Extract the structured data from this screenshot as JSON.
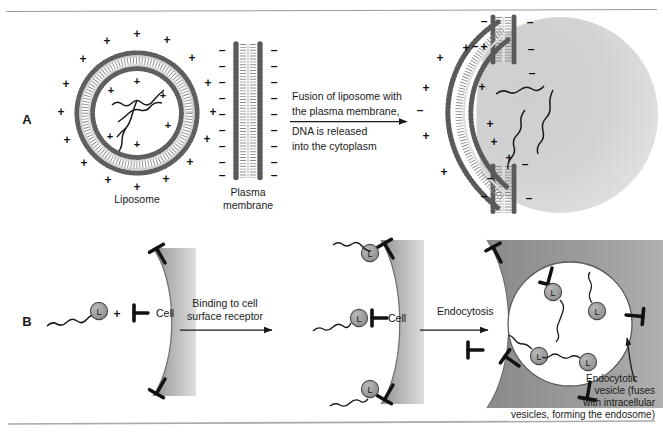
{
  "figure": {
    "background": "#ffffff",
    "top_rule": true,
    "bottom_rule": true
  },
  "panels": [
    {
      "id": "A",
      "label": "A",
      "stages": [
        {
          "name": "liposome",
          "caption": "Liposome",
          "surface_charge": "+",
          "inner_charge": "+",
          "contents": "DNA",
          "outer_charge_count": 20,
          "inner_charge_count": 8,
          "dna_strand_count": 3
        },
        {
          "name": "plasma-membrane",
          "caption_line1": "Plasma",
          "caption_line2": "membrane",
          "left_charge": "–",
          "right_charge": "–",
          "left_charge_count": 9,
          "right_charge_count": 9
        },
        {
          "name": "fused-cell",
          "caption": "",
          "liposome_charge": "+",
          "membrane_charge": "–",
          "released_dna_count": 3
        }
      ],
      "arrow": {
        "name": "fusion-arrow",
        "lines_above": [
          "Fusion of liposome with",
          "the plasma membrane,"
        ],
        "lines_below": [
          "DNA is released",
          "into the cytoplasm"
        ]
      }
    },
    {
      "id": "B",
      "label": "B",
      "stages": [
        {
          "name": "free-ligand-and-cell",
          "cell_label": "Cell",
          "ligand_label": "L",
          "plus_sign": "+",
          "receptor_count": 3,
          "ligand_complex_count": 1
        },
        {
          "name": "ligand-bound-cell",
          "cell_label": "Cell",
          "ligand_label": "L",
          "receptor_count": 3,
          "ligand_complex_count": 3
        },
        {
          "name": "endocytotic-vesicle-cell",
          "ligand_label": "L",
          "receptor_count": 7,
          "internal_ligand_count": 4
        }
      ],
      "arrows": [
        {
          "name": "binding-arrow",
          "lines_above": [
            "Binding to cell",
            "surface receptor"
          ]
        },
        {
          "name": "endocytosis-arrow",
          "lines_above": [
            "Endocytosis"
          ]
        }
      ],
      "callout": {
        "name": "endocytotic-vesicle-callout",
        "lines": [
          "Endocytotic",
          "vesicle (fuses",
          "with intracellular",
          "vesicles, forming the endosome)"
        ]
      }
    }
  ],
  "colors": {
    "ink": "#1a1a1a",
    "cytoplasm_light": "#d8d8d8",
    "cytoplasm_mid": "#b4b4b4",
    "cytoplasm_dark": "#9a9a9a",
    "lipid_head": "#6e6e6e",
    "lipid_head_dark": "#4a4a4a",
    "ligand_fill": "#9e9e9e",
    "rule": "#9a9a9a",
    "vesicle_lumen": "#ffffff"
  },
  "icons": {
    "plus": "+",
    "minus": "–",
    "ligand": "L"
  }
}
